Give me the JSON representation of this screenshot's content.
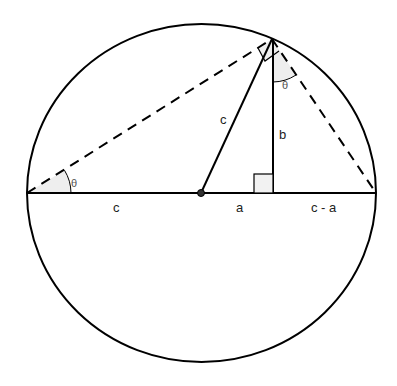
{
  "diagram": {
    "type": "geometry",
    "colors": {
      "stroke": "#000000",
      "angle_fill": "#eeeeee",
      "label": "#222222",
      "theta_label": "#555555"
    },
    "labels": {
      "left_segment": "c",
      "center_segment": "a",
      "right_segment": "c - a",
      "radius": "c",
      "altitude": "b",
      "angle_left": "θ",
      "angle_top": "θ"
    },
    "elements": [
      {
        "name": "circle",
        "center": [
          201,
          193
        ],
        "rx": 174.5,
        "ry": 169
      },
      {
        "name": "diameter",
        "from": [
          27,
          193
        ],
        "to": [
          376,
          193
        ],
        "style": "solid"
      },
      {
        "name": "radius",
        "from": [
          201,
          193
        ],
        "to": [
          272,
          39
        ],
        "style": "solid"
      },
      {
        "name": "altitude",
        "from": [
          273,
          39
        ],
        "to": [
          273,
          193
        ],
        "style": "solid"
      },
      {
        "name": "left-chord",
        "from": [
          27,
          193
        ],
        "to": [
          272,
          39
        ],
        "style": "dashed"
      },
      {
        "name": "right-chord",
        "from": [
          272,
          39
        ],
        "to": [
          376,
          193
        ],
        "style": "dashed"
      },
      {
        "name": "center-point",
        "at": [
          201,
          193
        ]
      },
      {
        "name": "right-angle-foot",
        "at": [
          273,
          193
        ]
      },
      {
        "name": "right-angle-apex",
        "at": [
          272,
          39
        ]
      }
    ]
  }
}
